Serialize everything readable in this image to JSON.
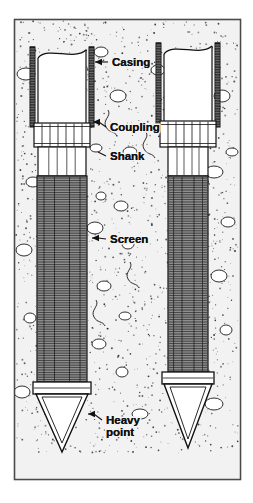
{
  "figure": {
    "kind": "engineering-cross-section",
    "title_visible": false,
    "frame": {
      "x": 14,
      "y": 19,
      "width": 226,
      "height": 460,
      "border_color": "#4a4a4a"
    },
    "background_color": "#ffffff",
    "ink_color": "#111111",
    "soil_fill_color": "#f2f2f2",
    "screen_fill_color": "#8d8d8d",
    "casing_fill_color": "#3a3a3a"
  },
  "labels": [
    {
      "id": "casing",
      "text": "Casing",
      "x": 112,
      "y": 66,
      "leader_to_x": 95,
      "leader_to_y": 62,
      "arrow": true
    },
    {
      "id": "coupling",
      "text": "Coupling",
      "x": 110,
      "y": 131,
      "leader_to_x": 93,
      "leader_to_y": 122,
      "arrow": true
    },
    {
      "id": "shank",
      "text": "Shank",
      "x": 110,
      "y": 160,
      "leader_to_x": 93,
      "leader_to_y": 152,
      "arrow": false
    },
    {
      "id": "screen",
      "text": "Screen",
      "x": 110,
      "y": 243,
      "leader_to_x": 92,
      "leader_to_y": 238,
      "arrow": true
    },
    {
      "id": "heavy-point",
      "text": "Heavy",
      "x": 106,
      "y": 424,
      "leader_to_x": 88,
      "leader_to_y": 414,
      "arrow": true
    },
    {
      "id": "heavy-point-2",
      "text": "point",
      "x": 106,
      "y": 436,
      "leader_to_x": 0,
      "leader_to_y": 0,
      "arrow": false
    }
  ],
  "wells": [
    {
      "id": "left-well",
      "name": "driven-well-point-with-casing",
      "center_x": 62,
      "casing": {
        "top": 47,
        "bottom": 127,
        "outer_half_width": 32,
        "wall_thickness": 5
      },
      "riser_pipe": {
        "top": 47,
        "bottom": 127,
        "half_width": 24,
        "break_at_top": true
      },
      "coupling": {
        "top": 123,
        "bottom": 147,
        "half_width": 28,
        "vertical_lines": 7
      },
      "shank": {
        "top": 147,
        "bottom": 176,
        "half_width": 24
      },
      "screen": {
        "top": 176,
        "bottom": 382,
        "half_width": 25,
        "hatch": "horizontal"
      },
      "point": {
        "collar_top": 382,
        "collar_bottom": 394,
        "collar_half_width": 29,
        "tip_y": 452,
        "cone_half_width": 26
      }
    },
    {
      "id": "right-well",
      "name": "driven-well-point-with-casing",
      "center_x": 188,
      "casing": {
        "top": 43,
        "bottom": 127,
        "outer_half_width": 32,
        "wall_thickness": 5
      },
      "riser_pipe": {
        "top": 43,
        "bottom": 127,
        "half_width": 24,
        "break_at_top": true
      },
      "coupling": {
        "top": 121,
        "bottom": 147,
        "half_width": 28,
        "vertical_lines": 7
      },
      "shank": {
        "top": 147,
        "bottom": 176,
        "half_width": 20
      },
      "screen": {
        "top": 176,
        "bottom": 372,
        "half_width": 20,
        "hatch": "horizontal"
      },
      "point": {
        "collar_top": 372,
        "collar_bottom": 384,
        "collar_half_width": 26,
        "tip_y": 448,
        "cone_half_width": 24
      }
    }
  ],
  "soil": {
    "name": "granular-soil-stipple",
    "stipple_dot_count": 1500,
    "pebble_count": 26,
    "pebble_color": "#ffffff",
    "pebble_stroke": "#1a1a1a"
  },
  "caption": {
    "text": "",
    "visible": false
  }
}
